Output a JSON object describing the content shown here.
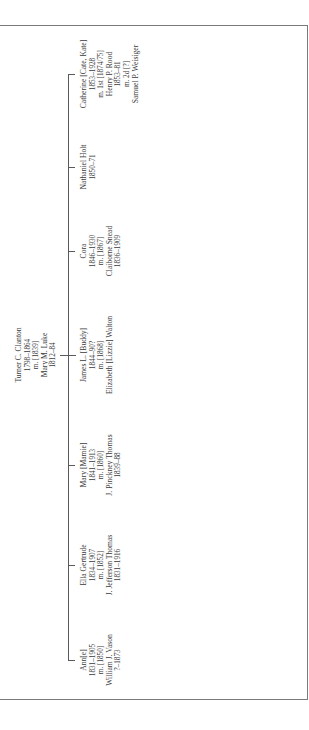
{
  "chart": {
    "orientation": "rotated 90° counter-clockwise (text reads bottom to top)",
    "parent": {
      "lines": [
        "Turner C. Clanton",
        "1798–1864",
        "m. [1839]",
        "Mary M. Luke",
        "1812–84"
      ]
    },
    "children": [
      {
        "id": "catherine",
        "lines": [
          "Catherine [Cate, Kate]",
          "1853–1928",
          "m. 1st [1874/75]",
          "Henry P. Rood",
          "1853–81",
          "m. 2d [?]",
          "Samuel P. Weisiger"
        ]
      },
      {
        "id": "nathaniel",
        "lines": [
          "Nathaniel Holt",
          "1850–71"
        ]
      },
      {
        "id": "cora",
        "lines": [
          "Cora",
          "1846–1930",
          "m. [1867]",
          "Claiborne Snead",
          "1836–1909"
        ]
      },
      {
        "id": "james",
        "lines": [
          "James L. [Buddy]",
          "1844–90?",
          "m. [1868]",
          "Elizabeth [Lizzie] Walton"
        ]
      },
      {
        "id": "mary",
        "lines": [
          "Mary [Mamie]",
          "1841–1913",
          "m. [1860]",
          "J. Pinckney Thomas",
          "1839–88"
        ]
      },
      {
        "id": "ella",
        "lines": [
          "Ella Gertrude",
          "1834–1907",
          "m. [1852]",
          "J. Jefferson Thomas",
          "1831–1916"
        ]
      },
      {
        "id": "ann",
        "lines": [
          "Ann[e]",
          "1831–1905",
          "m. [1850]",
          "William J. Vason",
          "?–1873"
        ]
      }
    ]
  },
  "colors": {
    "line": "#5a5a5a",
    "frame": "#7a7a7a",
    "text": "#3a3a3a",
    "background": "#ffffff"
  }
}
